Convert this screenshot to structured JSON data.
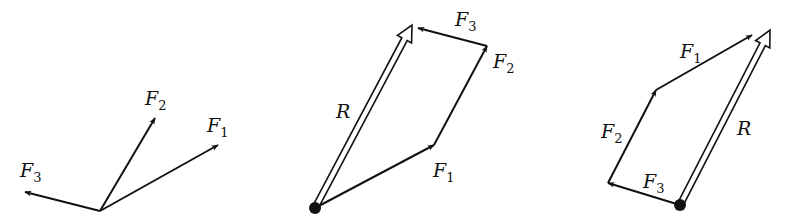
{
  "figure": {
    "panels": [
      {
        "id": "components",
        "vectors": [
          {
            "name": "F",
            "sub": "1",
            "from": [
              100,
              211
            ],
            "to": [
              218,
              145
            ]
          },
          {
            "name": "F",
            "sub": "2",
            "from": [
              100,
              211
            ],
            "to": [
              155,
              118
            ]
          },
          {
            "name": "F",
            "sub": "3",
            "from": [
              100,
              211
            ],
            "to": [
              25,
              192
            ]
          }
        ],
        "labels": [
          {
            "name": "F",
            "sub": "2",
            "x": 145,
            "y": 105
          },
          {
            "name": "F",
            "sub": "1",
            "x": 207,
            "y": 132
          },
          {
            "name": "F",
            "sub": "3",
            "x": 20,
            "y": 177
          }
        ]
      },
      {
        "id": "polygon-order-123",
        "origin_dot": [
          315,
          208
        ],
        "vectors": [
          {
            "name": "F",
            "sub": "1",
            "from": [
              315,
              208
            ],
            "to": [
              434,
              145
            ]
          },
          {
            "name": "F",
            "sub": "2",
            "from": [
              434,
              145
            ],
            "to": [
              487,
              46
            ]
          },
          {
            "name": "F",
            "sub": "3",
            "from": [
              487,
              46
            ],
            "to": [
              418,
              28
            ]
          }
        ],
        "resultant": {
          "name": "R",
          "from": [
            315,
            208
          ],
          "to": [
            412,
            25
          ]
        },
        "labels": [
          {
            "name": "F",
            "sub": "3",
            "x": 455,
            "y": 26
          },
          {
            "name": "F",
            "sub": "2",
            "x": 493,
            "y": 68
          },
          {
            "name": "R",
            "sub": "",
            "x": 336,
            "y": 118
          },
          {
            "name": "F",
            "sub": "1",
            "x": 433,
            "y": 177
          }
        ]
      },
      {
        "id": "polygon-order-321",
        "origin_dot": [
          680,
          205
        ],
        "vectors": [
          {
            "name": "F",
            "sub": "3",
            "from": [
              680,
              205
            ],
            "to": [
              608,
              183
            ]
          },
          {
            "name": "F",
            "sub": "2",
            "from": [
              608,
              183
            ],
            "to": [
              656,
              90
            ]
          },
          {
            "name": "F",
            "sub": "1",
            "from": [
              656,
              90
            ],
            "to": [
              752,
              35
            ]
          }
        ],
        "resultant": {
          "name": "R",
          "from": [
            680,
            205
          ],
          "to": [
            770,
            30
          ]
        },
        "labels": [
          {
            "name": "F",
            "sub": "1",
            "x": 680,
            "y": 58
          },
          {
            "name": "F",
            "sub": "2",
            "x": 601,
            "y": 138
          },
          {
            "name": "F",
            "sub": "3",
            "x": 643,
            "y": 188
          },
          {
            "name": "R",
            "sub": "",
            "x": 737,
            "y": 135
          }
        ]
      }
    ]
  }
}
